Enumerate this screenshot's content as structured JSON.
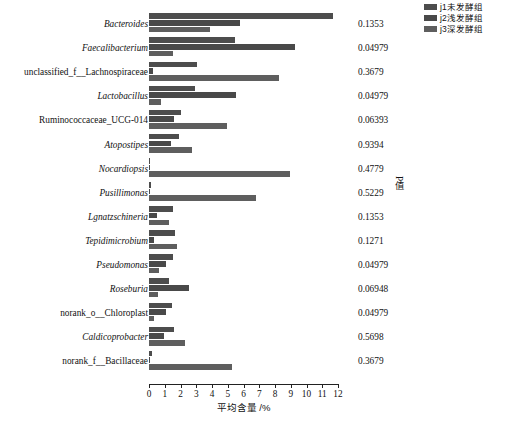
{
  "legend": {
    "items": [
      {
        "label": "j1未发酵组",
        "color": "#4d4d4d",
        "key": "j1"
      },
      {
        "label": "j2浅发酵组",
        "color": "#494949",
        "key": "j2"
      },
      {
        "label": "j3深发酵组",
        "color": "#5e5e5e",
        "key": "j3"
      }
    ]
  },
  "axis": {
    "x_title": "平均含量 /%",
    "p_axis_label": "P值",
    "ticks": [
      "0",
      "1",
      "2",
      "3",
      "4",
      "5",
      "6",
      "7",
      "8",
      "9",
      "10",
      "11",
      "12"
    ]
  },
  "chart_data": {
    "type": "bar",
    "orientation": "horizontal",
    "title": "",
    "xlabel": "平均含量 /%",
    "ylabel": "",
    "xlim": [
      0,
      12
    ],
    "grid": false,
    "legend_position": "top-right",
    "categories": [
      "Bacteroides",
      "Faecalibacterium",
      "unclassified_f__Lachnospiraceae",
      "Lactobacillus",
      "Ruminococcaceae_UCG-014",
      "Atopostipes",
      "Nocardiopsis",
      "Pusillimonas",
      "Lgnatzschineria",
      "Tepidimicrobium",
      "Pseudomonas",
      "Roseburia",
      "norank_o__Chloroplast",
      "Caldicoprobacter",
      "norank_f__Bacillaceae"
    ],
    "category_italic": [
      true,
      true,
      false,
      true,
      false,
      true,
      true,
      true,
      true,
      true,
      true,
      true,
      false,
      true,
      false
    ],
    "series": [
      {
        "name": "j1未发酵组",
        "color": "#4d4d4d",
        "values": [
          11.68,
          5.45,
          3.05,
          2.95,
          2.0,
          1.9,
          0.03,
          0.1,
          1.55,
          1.65,
          1.52,
          1.25,
          1.45,
          1.6,
          0.2
        ]
      },
      {
        "name": "j2浅发酵组",
        "color": "#494949",
        "values": [
          5.8,
          9.25,
          0.26,
          5.5,
          1.6,
          1.4,
          0.02,
          0.02,
          0.52,
          0.34,
          1.07,
          2.55,
          1.1,
          0.95,
          0.05
        ]
      },
      {
        "name": "j3深发酵组",
        "color": "#5e5e5e",
        "values": [
          3.9,
          1.5,
          8.25,
          0.75,
          4.95,
          2.75,
          8.95,
          6.8,
          1.25,
          1.8,
          0.62,
          0.55,
          0.3,
          2.3,
          5.3
        ]
      }
    ],
    "p_values": [
      "0.1353",
      "0.04979",
      "0.3679",
      "0.04979",
      "0.06393",
      "0.9394",
      "0.4779",
      "0.5229",
      "0.1353",
      "0.1271",
      "0.04979",
      "0.06948",
      "0.04979",
      "0.5698",
      "0.3679"
    ]
  }
}
